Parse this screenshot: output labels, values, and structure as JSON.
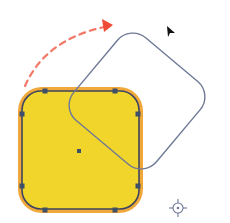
{
  "scene": {
    "description": "Rotate transformation illustration",
    "colors": {
      "fill": "#f1d52a",
      "halo": "#f0a83a",
      "stroke": "#3c4660",
      "rotated_outline": "#6f7896",
      "arrow": "#ef4b36",
      "handle": "#3d5068",
      "cursor": "#111111",
      "crosshair": "#6f7896"
    },
    "shape": {
      "x": 19,
      "y": 88,
      "width": 123,
      "height": 124,
      "radius": 22
    },
    "rotated_shape": {
      "cx": 137,
      "cy": 101,
      "width": 108,
      "height": 108,
      "radius": 20,
      "angle": 40
    },
    "handles": [
      {
        "x": 45,
        "y": 91
      },
      {
        "x": 115,
        "y": 91
      },
      {
        "x": 22,
        "y": 114
      },
      {
        "x": 138,
        "y": 114
      },
      {
        "x": 22,
        "y": 186
      },
      {
        "x": 138,
        "y": 186
      },
      {
        "x": 45,
        "y": 210
      },
      {
        "x": 115,
        "y": 210
      }
    ],
    "center_point": {
      "x": 79,
      "y": 151
    }
  }
}
